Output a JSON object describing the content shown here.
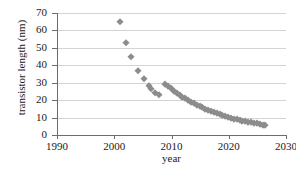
{
  "chart_data": {
    "type": "scatter",
    "title": "",
    "xlabel": "year",
    "ylabel": "transistor length (nm)",
    "xlim": [
      1990,
      2030
    ],
    "ylim": [
      0,
      70
    ],
    "xticks": [
      1990,
      2000,
      2010,
      2020,
      2030
    ],
    "yticks": [
      0,
      10,
      20,
      30,
      40,
      50,
      60,
      70
    ],
    "grid": "horizontal",
    "legend": "none",
    "marker": "diamond",
    "marker_color": "#8c8c8c",
    "series": [
      {
        "name": "early nodes",
        "points": [
          [
            2001.0,
            65
          ],
          [
            2002.0,
            53
          ],
          [
            2003.0,
            45
          ],
          [
            2004.2,
            37
          ],
          [
            2005.2,
            32
          ],
          [
            2006.0,
            28
          ],
          [
            2006.5,
            26.5
          ],
          [
            2007.2,
            24
          ],
          [
            2007.8,
            23
          ]
        ]
      },
      {
        "name": "projected roadmap",
        "points": [
          [
            2008.9,
            29
          ],
          [
            2009.4,
            28
          ],
          [
            2009.9,
            27
          ],
          [
            2010.4,
            25.5
          ],
          [
            2010.9,
            24
          ],
          [
            2011.4,
            23
          ],
          [
            2011.9,
            22
          ],
          [
            2012.4,
            21
          ],
          [
            2012.9,
            20
          ],
          [
            2013.4,
            19
          ],
          [
            2013.9,
            18.2
          ],
          [
            2014.4,
            17.4
          ],
          [
            2014.9,
            16.6
          ],
          [
            2015.4,
            15.8
          ],
          [
            2015.9,
            15.1
          ],
          [
            2016.4,
            14.4
          ],
          [
            2016.9,
            13.7
          ],
          [
            2017.4,
            13.1
          ],
          [
            2017.9,
            12.5
          ],
          [
            2018.4,
            11.9
          ],
          [
            2018.9,
            11.3
          ],
          [
            2019.4,
            10.8
          ],
          [
            2019.9,
            10.3
          ],
          [
            2020.4,
            9.8
          ],
          [
            2020.9,
            9.4
          ],
          [
            2021.4,
            9.0
          ],
          [
            2021.9,
            8.6
          ],
          [
            2022.4,
            8.2
          ],
          [
            2022.9,
            7.9
          ],
          [
            2023.4,
            7.5
          ],
          [
            2023.9,
            7.2
          ],
          [
            2024.4,
            6.9
          ],
          [
            2024.9,
            6.6
          ],
          [
            2025.4,
            6.2
          ],
          [
            2025.9,
            5.8
          ],
          [
            2026.3,
            5.5
          ]
        ]
      }
    ]
  }
}
